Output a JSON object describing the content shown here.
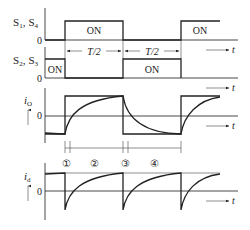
{
  "diagram": {
    "type": "switching-timing-waveforms",
    "signals": {
      "s1_s4": {
        "label_a": "S",
        "label_a_sub": "1",
        "label_sep": ",",
        "label_b": "S",
        "label_b_sub": "4",
        "zero": "0",
        "on_labels": [
          "ON",
          "ON"
        ]
      },
      "s2_s3": {
        "label_a": "S",
        "label_a_sub": "2",
        "label_sep": ",",
        "label_b": "S",
        "label_b_sub": "3",
        "zero": "0",
        "on_labels": [
          "ON",
          "ON"
        ]
      },
      "io": {
        "label": "i",
        "label_sub": "O",
        "zero": "0"
      },
      "id": {
        "label": "i",
        "label_sub": "d",
        "zero": "0"
      }
    },
    "period_labels": [
      "T/2",
      "T/2"
    ],
    "time_axis_label": "t",
    "intervals": [
      "①",
      "②",
      "③",
      "④"
    ]
  }
}
